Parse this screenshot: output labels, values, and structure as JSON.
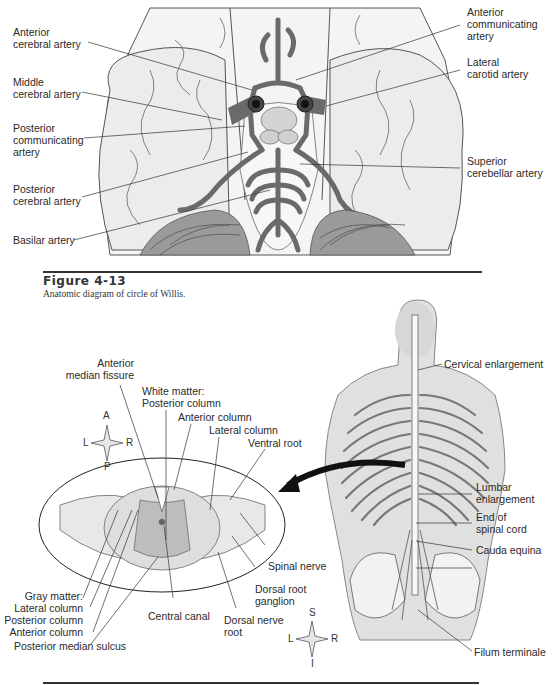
{
  "figure_top": {
    "number": "Figure  4-13",
    "caption": "Anatomic diagram of circle of Willis.",
    "labels": {
      "anterior_cerebral": "Anterior\ncerebral artery",
      "middle_cerebral": "Middle\ncerebral artery",
      "posterior_communicating": "Posterior\ncommunicating\nartery",
      "posterior_cerebral": "Posterior\ncerebral artery",
      "basilar": "Basilar artery",
      "anterior_communicating": "Anterior\ncommunicating\nartery",
      "lateral_carotid": "Lateral\ncarotid artery",
      "superior_cerebellar": "Superior\ncerebellar artery"
    }
  },
  "figure_bottom": {
    "cross_section_labels": {
      "anterior_median_fissure": "Anterior\nmedian fissure",
      "white_matter_posterior": "White matter:\nPosterior column",
      "anterior_column": "Anterior column",
      "lateral_column": "Lateral column",
      "ventral_root": "Ventral root",
      "spinal_nerve": "Spinal nerve",
      "dorsal_root_ganglion": "Dorsal root\nganglion",
      "dorsal_nerve_root": "Dorsal nerve\nroot",
      "central_canal": "Central canal",
      "gray_matter": "Gray matter:\nLateral column\nPosterior column\nAnterior column",
      "posterior_median_sulcus": "Posterior median sulcus"
    },
    "body_labels": {
      "cervical_enlargement": "Cervical enlargement",
      "lumbar_enlargement": "Lumbar\nenlargement",
      "end_of_spinal_cord": "End of\nspinal cord",
      "cauda_equina": "Cauda equina",
      "filum_terminale": "Filum terminale"
    },
    "compass_cross_section": {
      "top": "A",
      "bottom": "P",
      "left": "L",
      "right": "R"
    },
    "compass_body": {
      "top": "S",
      "bottom": "I",
      "left": "L",
      "right": "R"
    }
  }
}
